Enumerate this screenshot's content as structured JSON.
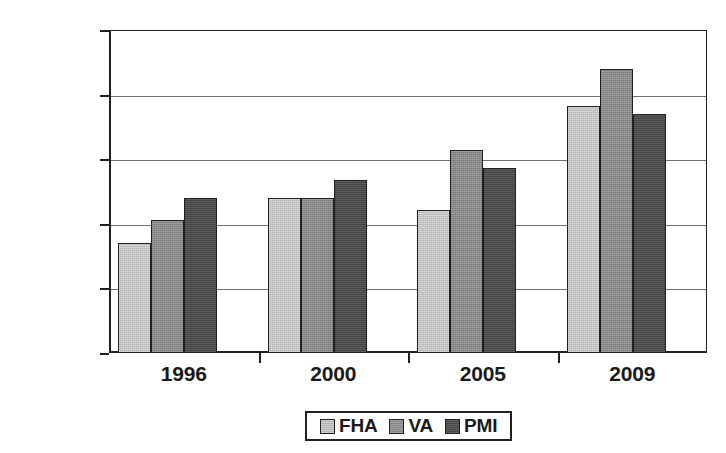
{
  "chart_data": {
    "type": "bar",
    "title": "",
    "subtitle": "",
    "xlabel": "",
    "ylabel": "",
    "categories": [
      "1996",
      "2000",
      "2005",
      "2009"
    ],
    "series": [
      {
        "name": "FHA",
        "color": "#b5b5b5",
        "values": [
          85000,
          120000,
          111000,
          191000
        ]
      },
      {
        "name": "VA",
        "color": "#868686",
        "values": [
          103000,
          120000,
          157000,
          220000
        ]
      },
      {
        "name": "PMI",
        "color": "#474747",
        "values": [
          120000,
          134000,
          143000,
          185000
        ]
      }
    ],
    "ylim": [
      0,
      250000
    ],
    "ytick_values": [
      0,
      50000,
      100000,
      150000,
      200000,
      250000
    ],
    "ytick_labels": [
      "$0",
      "$50,000",
      "$100,000",
      "$150,000",
      "$200,000",
      "$250,000"
    ],
    "grid": true,
    "grid_axis": "y",
    "legend": {
      "position": "bottom-center",
      "entries": [
        "FHA",
        "VA",
        "PMI"
      ]
    },
    "bar_group_order": [
      "FHA",
      "VA",
      "PMI"
    ],
    "background_color": "#ffffff",
    "axis_color": "#231f20"
  }
}
